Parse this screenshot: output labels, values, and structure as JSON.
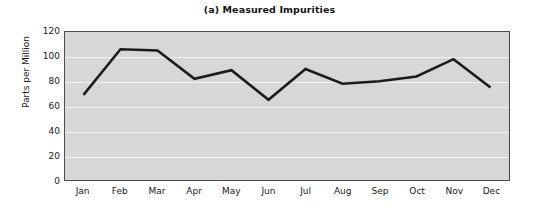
{
  "chart_data": {
    "type": "line",
    "title": "(a) Measured Impurities",
    "xlabel": "",
    "ylabel": "Parts per Million",
    "categories": [
      "Jan",
      "Feb",
      "Mar",
      "Apr",
      "May",
      "Jun",
      "Jul",
      "Aug",
      "Sep",
      "Oct",
      "Nov",
      "Dec"
    ],
    "values": [
      69,
      106,
      105,
      82,
      89,
      65,
      90,
      78,
      80,
      84,
      98,
      75
    ],
    "series": [
      {
        "name": "Measured Impurities",
        "values": [
          69,
          106,
          105,
          82,
          89,
          65,
          90,
          78,
          80,
          84,
          98,
          75
        ]
      }
    ],
    "ylim": [
      0,
      120
    ],
    "y_ticks": [
      0,
      20,
      40,
      60,
      80,
      100,
      120
    ],
    "x_ticks": [
      "Jan",
      "Feb",
      "Mar",
      "Apr",
      "May",
      "Jun",
      "Jul",
      "Aug",
      "Sep",
      "Oct",
      "Nov",
      "Dec"
    ],
    "grid": true,
    "grid_orientation": "horizontal",
    "legend": false,
    "legend_position": "none",
    "markers": false,
    "colors": {
      "line": "#1c1c1c",
      "plot_background": "#d7d7d7",
      "gridline": "#f2f2f2",
      "axis_border": "#4a4a4a",
      "text": "#1a1a1a",
      "page_background": "#ffffff"
    },
    "line_width": 2.6
  }
}
